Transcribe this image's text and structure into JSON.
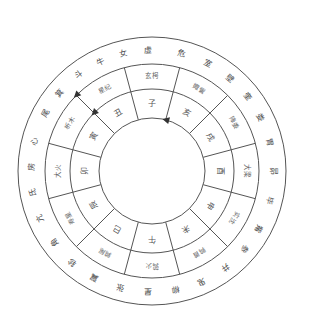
{
  "diagram": {
    "title": "",
    "center": {
      "x": 152,
      "y": 171
    },
    "radii": {
      "outer": 134,
      "stations_outer": 107,
      "branches_outer": 82,
      "inner": 53
    },
    "colors": {
      "line": "#555555",
      "text": "#555555",
      "arrow": "#333333",
      "background": "#ffffff"
    },
    "branches": [
      {
        "label": "子",
        "angle": 0
      },
      {
        "label": "丑",
        "angle": 30
      },
      {
        "label": "寅",
        "angle": 60
      },
      {
        "label": "卯",
        "angle": 90
      },
      {
        "label": "辰",
        "angle": 120
      },
      {
        "label": "巳",
        "angle": 150
      },
      {
        "label": "午",
        "angle": 180
      },
      {
        "label": "未",
        "angle": 210
      },
      {
        "label": "申",
        "angle": 240
      },
      {
        "label": "酉",
        "angle": 270
      },
      {
        "label": "戌",
        "angle": 300
      },
      {
        "label": "亥",
        "angle": 330
      }
    ],
    "stations": [
      {
        "label": "玄枵",
        "angle": 0
      },
      {
        "label": "星纪",
        "angle": 30
      },
      {
        "label": "析木",
        "angle": 60
      },
      {
        "label": "大火",
        "angle": 90
      },
      {
        "label": "寿星",
        "angle": 120
      },
      {
        "label": "鹑尾",
        "angle": 150
      },
      {
        "label": "鹑火",
        "angle": 180
      },
      {
        "label": "鹑首",
        "angle": 210
      },
      {
        "label": "实沈",
        "angle": 240
      },
      {
        "label": "大梁",
        "angle": 270
      },
      {
        "label": "降娄",
        "angle": 300
      },
      {
        "label": "娵訾",
        "angle": 330
      }
    ],
    "mansions": [
      {
        "label": "虚",
        "angle": 2
      },
      {
        "label": "女",
        "angle": 14
      },
      {
        "label": "牛",
        "angle": 25
      },
      {
        "label": "斗",
        "angle": 37
      },
      {
        "label": "箕",
        "angle": 50
      },
      {
        "label": "尾",
        "angle": 62
      },
      {
        "label": "心",
        "angle": 76
      },
      {
        "label": "房",
        "angle": 88
      },
      {
        "label": "氐",
        "angle": 100
      },
      {
        "label": "亢",
        "angle": 113
      },
      {
        "label": "角",
        "angle": 126
      },
      {
        "label": "轸",
        "angle": 139
      },
      {
        "label": "翼",
        "angle": 152
      },
      {
        "label": "张",
        "angle": 165
      },
      {
        "label": "星",
        "angle": 178
      },
      {
        "label": "柳",
        "angle": 191
      },
      {
        "label": "鬼",
        "angle": 204
      },
      {
        "label": "井",
        "angle": 217
      },
      {
        "label": "参",
        "angle": 230
      },
      {
        "label": "觜",
        "angle": 242
      },
      {
        "label": "毕",
        "angle": 256
      },
      {
        "label": "昴",
        "angle": 270
      },
      {
        "label": "胃",
        "angle": 284
      },
      {
        "label": "娄",
        "angle": 296
      },
      {
        "label": "奎",
        "angle": 308
      },
      {
        "label": "壁",
        "angle": 320
      },
      {
        "label": "室",
        "angle": 333
      },
      {
        "label": "危",
        "angle": 346
      }
    ],
    "arrows": [
      {
        "name": "inner-arrow",
        "radius": 53,
        "angle": 345
      },
      {
        "name": "middle-arrow",
        "radius": 82,
        "angle": 45
      },
      {
        "name": "outer-arrow",
        "radius": 107,
        "angle": 45
      }
    ]
  }
}
